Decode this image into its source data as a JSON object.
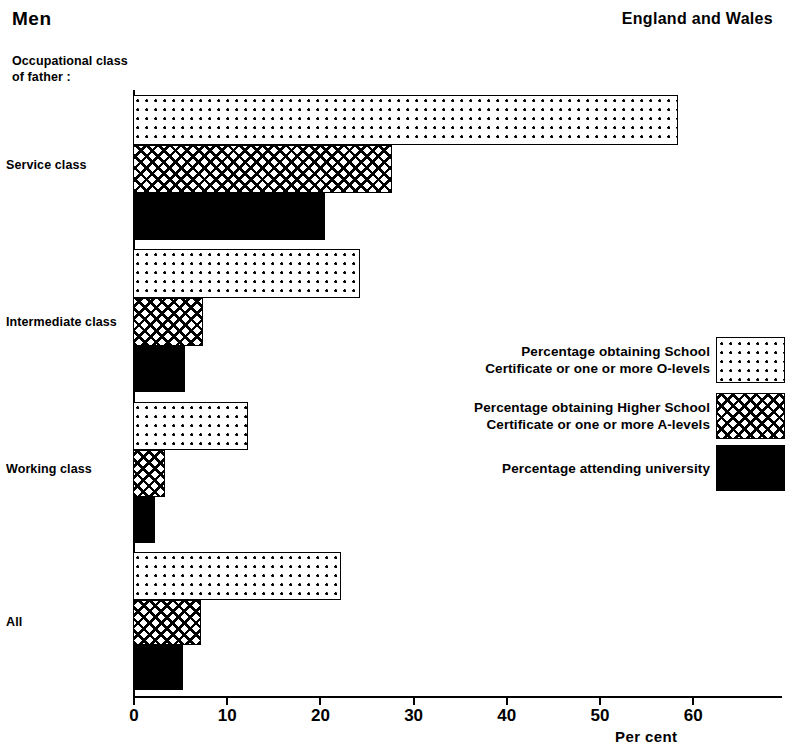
{
  "header": {
    "title": "Men",
    "region": "England and Wales"
  },
  "axis_group_title": "Occupational class\nof father :",
  "x_axis_title": "Per  cent",
  "legend": {
    "items": [
      {
        "label": "Percentage obtaining School\nCertificate or one or more O-levels",
        "pattern": "dotted"
      },
      {
        "label": "Percentage obtaining Higher School\nCertificate or one or more A-levels",
        "pattern": "hatched"
      },
      {
        "label": "Percentage attending university",
        "pattern": "solid"
      }
    ]
  },
  "chart_data": {
    "type": "bar",
    "orientation": "horizontal",
    "title": "Men",
    "subtitle": "England and Wales",
    "xlabel": "Per  cent",
    "ylabel": "Occupational class of father :",
    "xlim": [
      0,
      70
    ],
    "xticks": [
      0,
      10,
      20,
      30,
      40,
      50,
      60
    ],
    "xtick_labels": [
      "0",
      "10",
      "20",
      "30",
      "40",
      "50",
      "60"
    ],
    "grid": false,
    "legend_position": "middle-right",
    "categories": [
      "Service class",
      "Intermediate class",
      "Working class",
      "All"
    ],
    "series": [
      {
        "name": "Percentage obtaining School Certificate or one or more O-levels",
        "pattern": "dotted",
        "values": [
          58.5,
          24.4,
          12.3,
          22.3
        ]
      },
      {
        "name": "Percentage obtaining Higher School Certificate or one or more A-levels",
        "pattern": "hatched",
        "values": [
          27.8,
          7.5,
          3.4,
          7.3
        ]
      },
      {
        "name": "Percentage attending university",
        "pattern": "solid",
        "values": [
          20.6,
          5.6,
          2.4,
          5.4
        ]
      }
    ]
  },
  "layout": {
    "plot_left": 133,
    "px_per_unit": 9.32,
    "groups": [
      {
        "label_y": 158,
        "bar_tops": [
          95,
          145,
          193
        ],
        "bar_heights": [
          50,
          48,
          47
        ]
      },
      {
        "label_y": 315,
        "bar_tops": [
          249,
          298,
          346
        ],
        "bar_heights": [
          49,
          48,
          46
        ]
      },
      {
        "label_y": 462,
        "bar_tops": [
          402,
          450,
          497
        ],
        "bar_heights": [
          48,
          47,
          46
        ]
      },
      {
        "label_y": 615,
        "bar_tops": [
          552,
          600,
          645
        ],
        "bar_heights": [
          48,
          45,
          45
        ]
      }
    ]
  }
}
